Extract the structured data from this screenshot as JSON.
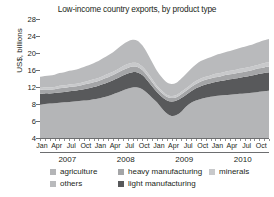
{
  "chart_data": {
    "type": "area",
    "title": "Low-income country exports, by product type",
    "xlabel": "",
    "ylabel": "US$, billions",
    "ylim": [
      4,
      28
    ],
    "yticks": [
      28,
      24,
      20,
      16,
      12,
      8,
      6,
      4
    ],
    "grid": false,
    "legend_position": "bottom",
    "stacked": true,
    "x": [
      "Jan 2007",
      "Feb 2007",
      "Mar 2007",
      "Apr 2007",
      "May 2007",
      "Jun 2007",
      "Jul 2007",
      "Aug 2007",
      "Sep 2007",
      "Oct 2007",
      "Nov 2007",
      "Dec 2007",
      "Jan 2008",
      "Feb 2008",
      "Mar 2008",
      "Apr 2008",
      "May 2008",
      "Jun 2008",
      "Jul 2008",
      "Aug 2008",
      "Sep 2008",
      "Oct 2008",
      "Nov 2008",
      "Dec 2008",
      "Jan 2009",
      "Feb 2009",
      "Mar 2009",
      "Apr 2009",
      "May 2009",
      "Jun 2009",
      "Jul 2009",
      "Aug 2009",
      "Sep 2009",
      "Oct 2009",
      "Nov 2009",
      "Dec 2009",
      "Jan 2010",
      "Feb 2010",
      "Mar 2010",
      "Apr 2010",
      "May 2010",
      "Jun 2010",
      "Jul 2010",
      "Aug 2010",
      "Sep 2010",
      "Oct 2010",
      "Nov 2010",
      "Dec 2010"
    ],
    "xtick_labels": [
      "Jan",
      "Apr",
      "Jul",
      "Oct"
    ],
    "year_groups": [
      "2007",
      "2008",
      "2009",
      "2010"
    ],
    "series": [
      {
        "name": "agriculture",
        "color": "#b4b5b7",
        "values": [
          7.9,
          8.0,
          8.1,
          8.2,
          8.3,
          8.4,
          8.5,
          8.6,
          8.7,
          8.8,
          8.9,
          9.1,
          9.3,
          9.6,
          9.9,
          10.3,
          10.7,
          11.2,
          11.6,
          11.9,
          11.9,
          11.5,
          10.6,
          9.5,
          8.4,
          7.5,
          6.9,
          6.6,
          6.7,
          7.1,
          7.7,
          8.3,
          8.8,
          9.2,
          9.5,
          9.7,
          9.9,
          10.0,
          10.1,
          10.2,
          10.3,
          10.4,
          10.5,
          10.6,
          10.7,
          10.9,
          11.0,
          11.1
        ]
      },
      {
        "name": "light manufacturing",
        "color": "#58595b",
        "values": [
          2.5,
          2.5,
          2.4,
          2.4,
          2.4,
          2.4,
          2.5,
          2.5,
          2.6,
          2.7,
          2.8,
          2.9,
          3.0,
          3.1,
          3.2,
          3.3,
          3.4,
          3.5,
          3.6,
          3.6,
          3.5,
          3.3,
          3.0,
          2.7,
          2.4,
          2.2,
          2.0,
          2.0,
          2.1,
          2.3,
          2.5,
          2.7,
          2.9,
          3.0,
          3.1,
          3.2,
          3.3,
          3.4,
          3.5,
          3.6,
          3.7,
          3.8,
          3.9,
          4.0,
          4.1,
          4.2,
          4.3,
          4.4
        ]
      },
      {
        "name": "heavy manufacturing",
        "color": "#a4a5a7",
        "values": [
          0.9,
          0.9,
          0.9,
          0.9,
          1.0,
          1.0,
          1.0,
          1.0,
          1.0,
          1.1,
          1.1,
          1.1,
          1.1,
          1.2,
          1.2,
          1.2,
          1.3,
          1.3,
          1.3,
          1.3,
          1.3,
          1.2,
          1.1,
          1.0,
          0.9,
          0.9,
          0.8,
          0.8,
          0.8,
          0.9,
          0.9,
          1.0,
          1.0,
          1.1,
          1.1,
          1.1,
          1.1,
          1.1,
          1.2,
          1.2,
          1.2,
          1.2,
          1.2,
          1.2,
          1.3,
          1.3,
          1.3,
          1.3
        ]
      },
      {
        "name": "minerals",
        "color": "#c8c9cb",
        "values": [
          0.5,
          0.5,
          0.5,
          0.5,
          0.6,
          0.6,
          0.6,
          0.6,
          0.6,
          0.6,
          0.7,
          0.7,
          0.7,
          0.7,
          0.8,
          0.8,
          0.8,
          0.9,
          0.9,
          0.9,
          0.9,
          0.8,
          0.8,
          0.7,
          0.6,
          0.6,
          0.5,
          0.5,
          0.5,
          0.6,
          0.6,
          0.6,
          0.7,
          0.7,
          0.7,
          0.7,
          0.8,
          0.8,
          0.8,
          0.8,
          0.8,
          0.9,
          0.9,
          0.9,
          0.9,
          0.9,
          1.0,
          1.0
        ]
      },
      {
        "name": "others",
        "color": "#b9babc",
        "values": [
          2.6,
          2.7,
          2.8,
          2.9,
          3.0,
          3.1,
          3.2,
          3.3,
          3.4,
          3.5,
          3.6,
          3.8,
          4.0,
          4.2,
          4.4,
          4.6,
          4.9,
          5.1,
          5.3,
          5.4,
          5.3,
          5.0,
          4.5,
          4.0,
          3.5,
          3.1,
          2.9,
          2.8,
          2.9,
          3.1,
          3.4,
          3.7,
          3.9,
          4.1,
          4.2,
          4.3,
          4.4,
          4.5,
          4.6,
          4.7,
          4.8,
          4.9,
          5.0,
          5.1,
          5.2,
          5.3,
          5.4,
          5.5
        ]
      }
    ]
  },
  "legend": {
    "row1": [
      {
        "label": "agriculture",
        "color": "#b4b5b7"
      },
      {
        "label": "heavy manufacturing",
        "color": "#a4a5a7"
      },
      {
        "label": "minerals",
        "color": "#c8c9cb"
      }
    ],
    "row2": [
      {
        "label": "others",
        "color": "#b9babc"
      },
      {
        "label": "light manufacturing",
        "color": "#58595b"
      }
    ]
  }
}
